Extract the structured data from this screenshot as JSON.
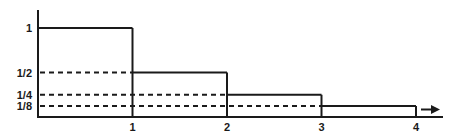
{
  "figure": {
    "background": "#ffffff",
    "line_color": "#1a1a1a",
    "text_color": "#1a1a1a"
  },
  "chart_data": {
    "type": "line",
    "subtype": "step-histogram",
    "title": "",
    "xlabel": "",
    "ylabel": "",
    "intervals": [
      [
        0,
        1
      ],
      [
        1,
        2
      ],
      [
        2,
        3
      ],
      [
        3,
        4
      ]
    ],
    "values": [
      1,
      0.5,
      0.25,
      0.125
    ],
    "value_labels": [
      "1",
      "1/2",
      "1/4",
      "1/8"
    ],
    "x_ticks": [
      1,
      2,
      3,
      4
    ],
    "x_tick_labels": [
      "1",
      "2",
      "3",
      "4"
    ],
    "y_ticks": [
      1,
      0.5,
      0.25,
      0.125
    ],
    "y_tick_labels": [
      "1",
      "1/2",
      "1/4",
      "1/8"
    ],
    "xlim": [
      0,
      4.3
    ],
    "ylim": [
      0,
      1.2
    ],
    "grid": "dashed horizontal guides from y-axis to each step",
    "guides": {
      "style": "dashed",
      "at": [
        0.5,
        0.25,
        0.125
      ],
      "extend_to_x": [
        1,
        2,
        3
      ]
    },
    "legend": "none",
    "continuation_arrow_right": true
  }
}
